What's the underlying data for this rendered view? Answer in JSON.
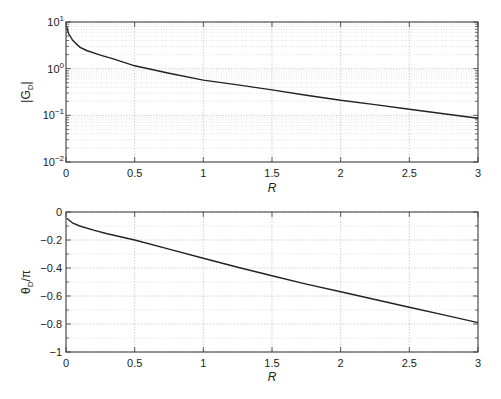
{
  "chart_data": [
    {
      "type": "line",
      "title": "",
      "xlabel": "R",
      "ylabel": "|G_D|",
      "yscale": "log",
      "xlim": [
        0,
        3
      ],
      "ylim": [
        0.01,
        10
      ],
      "grid": true,
      "minor_grid": true,
      "xticks": [
        0,
        0.5,
        1,
        1.5,
        2,
        2.5,
        3
      ],
      "xtick_labels": [
        "0",
        "0.5",
        "1",
        "1.5",
        "2",
        "2.5",
        "3"
      ],
      "yticks": [
        0.01,
        0.1,
        1,
        10
      ],
      "ytick_labels": [
        {
          "base": "10",
          "exp": "−2"
        },
        {
          "base": "10",
          "exp": "−1"
        },
        {
          "base": "10",
          "exp": "0"
        },
        {
          "base": "10",
          "exp": "1"
        }
      ],
      "series": [
        {
          "name": "|G_D|",
          "x": [
            0.005,
            0.02,
            0.05,
            0.1,
            0.15,
            0.25,
            0.35,
            0.5,
            0.75,
            1.0,
            1.25,
            1.5,
            1.75,
            2.0,
            2.25,
            2.5,
            2.75,
            3.0
          ],
          "y": [
            7.8,
            5.6,
            4.0,
            2.9,
            2.45,
            1.95,
            1.6,
            1.15,
            0.8,
            0.57,
            0.45,
            0.35,
            0.27,
            0.21,
            0.17,
            0.135,
            0.108,
            0.087
          ]
        }
      ]
    },
    {
      "type": "line",
      "title": "",
      "xlabel": "R",
      "ylabel": "θ_D/π",
      "yscale": "linear",
      "xlim": [
        0,
        3
      ],
      "ylim": [
        -1,
        0
      ],
      "grid": true,
      "minor_grid": true,
      "xticks": [
        0,
        0.5,
        1,
        1.5,
        2,
        2.5,
        3
      ],
      "xtick_labels": [
        "0",
        "0.5",
        "1",
        "1.5",
        "2",
        "2.5",
        "3"
      ],
      "yticks": [
        -1,
        -0.8,
        -0.6,
        -0.4,
        -0.2,
        0
      ],
      "ytick_labels": [
        "−1",
        "−0.8",
        "−0.6",
        "−0.4",
        "−0.2",
        "0"
      ],
      "series": [
        {
          "name": "θ_D/π",
          "x": [
            0.005,
            0.05,
            0.1,
            0.2,
            0.3,
            0.5,
            0.75,
            1.0,
            1.25,
            1.5,
            1.75,
            2.0,
            2.25,
            2.5,
            2.75,
            3.0
          ],
          "y": [
            -0.045,
            -0.08,
            -0.1,
            -0.13,
            -0.155,
            -0.2,
            -0.265,
            -0.33,
            -0.395,
            -0.455,
            -0.515,
            -0.57,
            -0.625,
            -0.68,
            -0.735,
            -0.79
          ]
        }
      ]
    }
  ],
  "plots": {
    "top": {
      "ylabel_main": "|G",
      "ylabel_sub": "D",
      "ylabel_end": "|",
      "xlabel": "R"
    },
    "bottom": {
      "ylabel_main": "θ",
      "ylabel_sub": "D",
      "ylabel_end": "/π",
      "xlabel": "R"
    }
  }
}
